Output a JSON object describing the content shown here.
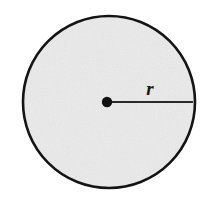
{
  "figure": {
    "kind": "geometry-diagram",
    "canvas": {
      "width": 210,
      "height": 203,
      "background_color": "#ffffff"
    },
    "circle": {
      "name": "circle",
      "center_x": 109,
      "center_y": 102,
      "radius": 86,
      "fill_color": "#eaeaea",
      "stroke_color": "#141414",
      "stroke_width": 2.6
    },
    "center_point": {
      "name": "center-point",
      "x": 107,
      "y": 102,
      "radius": 5.2,
      "fill_color": "#111111"
    },
    "radius_segment": {
      "name": "radius-segment",
      "x1": 107,
      "y1": 102,
      "x2": 193,
      "y2": 102,
      "stroke_color": "#2a2a2a",
      "stroke_width": 1.8
    },
    "radius_label": {
      "text": "r",
      "x": 150,
      "y": 95,
      "font_size": 19,
      "color": "#171717"
    }
  }
}
